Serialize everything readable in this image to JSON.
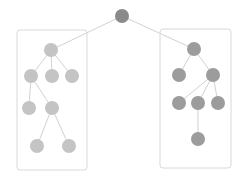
{
  "diagram": {
    "type": "tree",
    "colors": {
      "root": "#8a8a8a",
      "left": "#c4c4c4",
      "right": "#9c9c9c",
      "edge": "#d2d2d2",
      "box": "#d8d8d8"
    },
    "boxes": [
      {
        "id": "left-group",
        "x": 17,
        "y": 30,
        "w": 70,
        "h": 140
      },
      {
        "id": "right-group",
        "x": 160,
        "y": 29,
        "w": 71,
        "h": 139
      }
    ],
    "nodes": [
      {
        "id": "root",
        "x": 122,
        "y": 16,
        "r": 7,
        "group": "root"
      },
      {
        "id": "L1",
        "x": 51,
        "y": 50,
        "r": 7,
        "group": "left"
      },
      {
        "id": "L2",
        "x": 31,
        "y": 76,
        "r": 7,
        "group": "left"
      },
      {
        "id": "L3",
        "x": 52,
        "y": 76,
        "r": 7,
        "group": "left"
      },
      {
        "id": "L4",
        "x": 72,
        "y": 76,
        "r": 7,
        "group": "left"
      },
      {
        "id": "L5",
        "x": 29,
        "y": 108,
        "r": 7,
        "group": "left"
      },
      {
        "id": "L6",
        "x": 52,
        "y": 108,
        "r": 7,
        "group": "left"
      },
      {
        "id": "L7",
        "x": 37,
        "y": 146,
        "r": 7,
        "group": "left"
      },
      {
        "id": "L8",
        "x": 69,
        "y": 146,
        "r": 7,
        "group": "left"
      },
      {
        "id": "R1",
        "x": 194,
        "y": 49,
        "r": 7,
        "group": "right"
      },
      {
        "id": "R2",
        "x": 179,
        "y": 75,
        "r": 7,
        "group": "right"
      },
      {
        "id": "R3",
        "x": 213,
        "y": 75,
        "r": 7,
        "group": "right"
      },
      {
        "id": "R4",
        "x": 179,
        "y": 103,
        "r": 7,
        "group": "right"
      },
      {
        "id": "R5",
        "x": 198,
        "y": 103,
        "r": 7,
        "group": "right"
      },
      {
        "id": "R6",
        "x": 218,
        "y": 103,
        "r": 7,
        "group": "right"
      },
      {
        "id": "R7",
        "x": 198,
        "y": 139,
        "r": 7,
        "group": "right"
      }
    ],
    "edges": [
      [
        "root",
        "L1"
      ],
      [
        "root",
        "R1"
      ],
      [
        "L1",
        "L2"
      ],
      [
        "L1",
        "L3"
      ],
      [
        "L1",
        "L4"
      ],
      [
        "L2",
        "L5"
      ],
      [
        "L2",
        "L6"
      ],
      [
        "L6",
        "L7"
      ],
      [
        "L6",
        "L8"
      ],
      [
        "R1",
        "R2"
      ],
      [
        "R1",
        "R3"
      ],
      [
        "R3",
        "R4"
      ],
      [
        "R3",
        "R5"
      ],
      [
        "R3",
        "R6"
      ],
      [
        "R5",
        "R7"
      ]
    ]
  }
}
